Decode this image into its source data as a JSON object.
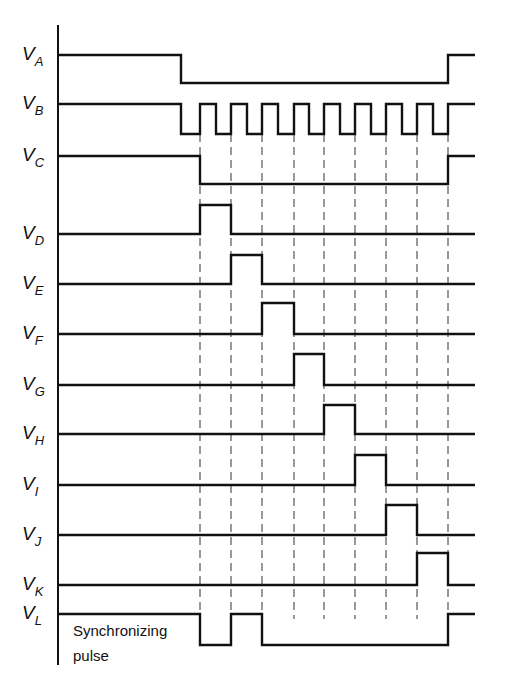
{
  "diagram": {
    "type": "timing-diagram",
    "axis_x": 58,
    "x_end": 475,
    "ticks_x": [
      200,
      231,
      262,
      294,
      324,
      355,
      386,
      417,
      448
    ],
    "signals": [
      {
        "id": "A",
        "label": "V",
        "sub": "A",
        "y_high": 55,
        "y_low": 83,
        "start": "high",
        "edges": [
          181,
          448
        ]
      },
      {
        "id": "B",
        "label": "V",
        "sub": "B",
        "y_high": 104,
        "y_low": 134,
        "start": "high",
        "edges": [
          181,
          200,
          216,
          231,
          247,
          262,
          278,
          294,
          309,
          324,
          340,
          355,
          371,
          386,
          402,
          417,
          433,
          448
        ]
      },
      {
        "id": "C",
        "label": "V",
        "sub": "C",
        "y_high": 156,
        "y_low": 184,
        "start": "high",
        "edges": [
          200,
          448
        ]
      },
      {
        "id": "D",
        "label": "V",
        "sub": "D",
        "y_high": 205,
        "y_low": 234,
        "start": "low",
        "edges": [
          200,
          231
        ]
      },
      {
        "id": "E",
        "label": "V",
        "sub": "E",
        "y_high": 255,
        "y_low": 284,
        "start": "low",
        "edges": [
          231,
          262
        ]
      },
      {
        "id": "F",
        "label": "V",
        "sub": "F",
        "y_high": 303,
        "y_low": 334,
        "start": "low",
        "edges": [
          262,
          294
        ]
      },
      {
        "id": "G",
        "label": "V",
        "sub": "G",
        "y_high": 354,
        "y_low": 385,
        "start": "low",
        "edges": [
          294,
          324
        ]
      },
      {
        "id": "H",
        "label": "V",
        "sub": "H",
        "y_high": 405,
        "y_low": 434,
        "start": "low",
        "edges": [
          324,
          355
        ]
      },
      {
        "id": "I",
        "label": "V",
        "sub": "I",
        "y_high": 455,
        "y_low": 485,
        "start": "low",
        "edges": [
          355,
          386
        ]
      },
      {
        "id": "J",
        "label": "V",
        "sub": "J",
        "y_high": 505,
        "y_low": 535,
        "start": "low",
        "edges": [
          386,
          417
        ]
      },
      {
        "id": "K",
        "label": "V",
        "sub": "K",
        "y_high": 553,
        "y_low": 585,
        "start": "low",
        "edges": [
          417,
          448
        ]
      },
      {
        "id": "L",
        "label": "V",
        "sub": "L",
        "y_high": 614,
        "y_low": 645,
        "start": "high",
        "edges": [
          200,
          231,
          262,
          448
        ]
      }
    ],
    "annotation_line1": "Synchronizing",
    "annotation_line2": "pulse"
  }
}
